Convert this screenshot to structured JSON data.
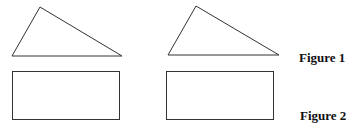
{
  "figures": [
    {
      "label": "Figure 1",
      "shape": "triangle"
    },
    {
      "label": "Figure 2",
      "shape": "rectangle"
    }
  ],
  "stroke_color": "#333333"
}
